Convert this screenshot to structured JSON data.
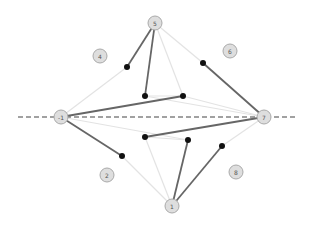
{
  "diagram": {
    "axis": {
      "y": 117,
      "x1": 18,
      "x2": 298,
      "color": "#444444",
      "dash": "5,3"
    },
    "colors": {
      "dark_edge": "#666666",
      "light_edge": "#e3e3e3",
      "point": "#111111",
      "node_fill": "#dedede",
      "node_stroke": "#aaaaaa"
    },
    "nodes": [
      {
        "id": "n5",
        "label": "5",
        "x": 155,
        "y": 23,
        "r": 7
      },
      {
        "id": "n4",
        "label": "4",
        "x": 100,
        "y": 56,
        "r": 7
      },
      {
        "id": "n6",
        "label": "6",
        "x": 230,
        "y": 51,
        "r": 7
      },
      {
        "id": "nL",
        "label": "-1",
        "x": 61,
        "y": 117,
        "r": 7
      },
      {
        "id": "nR",
        "label": "7",
        "x": 264,
        "y": 117,
        "r": 7
      },
      {
        "id": "n2",
        "label": "2",
        "x": 107,
        "y": 175,
        "r": 7
      },
      {
        "id": "n8",
        "label": "8",
        "x": 236,
        "y": 172,
        "r": 7
      },
      {
        "id": "n1",
        "label": "1",
        "x": 172,
        "y": 206,
        "r": 7
      }
    ],
    "points": [
      {
        "x": 127,
        "y": 67
      },
      {
        "x": 145,
        "y": 96
      },
      {
        "x": 183,
        "y": 96
      },
      {
        "x": 203,
        "y": 63
      },
      {
        "x": 145,
        "y": 137
      },
      {
        "x": 188,
        "y": 140
      },
      {
        "x": 122,
        "y": 156
      },
      {
        "x": 222,
        "y": 146
      }
    ],
    "light_edges": [
      [
        61,
        117,
        127,
        67
      ],
      [
        155,
        23,
        183,
        96
      ],
      [
        155,
        23,
        203,
        63
      ],
      [
        145,
        96,
        183,
        96
      ],
      [
        183,
        96,
        264,
        117
      ],
      [
        145,
        96,
        264,
        117
      ],
      [
        61,
        117,
        188,
        140
      ],
      [
        145,
        137,
        188,
        140
      ],
      [
        145,
        137,
        172,
        206
      ],
      [
        122,
        156,
        172,
        206
      ],
      [
        222,
        146,
        264,
        117
      ]
    ],
    "dark_edges": [
      [
        155,
        23,
        127,
        67
      ],
      [
        155,
        23,
        145,
        96
      ],
      [
        61,
        117,
        183,
        96
      ],
      [
        203,
        63,
        264,
        117
      ],
      [
        61,
        117,
        122,
        156
      ],
      [
        264,
        117,
        145,
        137
      ],
      [
        172,
        206,
        188,
        140
      ],
      [
        172,
        206,
        222,
        146
      ]
    ]
  }
}
